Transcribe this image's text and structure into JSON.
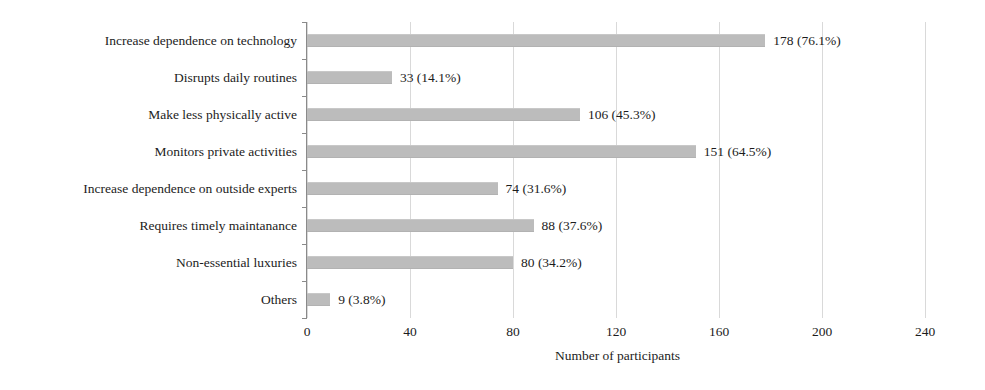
{
  "chart_data": {
    "type": "bar",
    "orientation": "horizontal",
    "title": "",
    "xlabel": "Number of participants",
    "ylabel": "",
    "xlim": [
      0,
      240
    ],
    "xticks": [
      0,
      40,
      80,
      120,
      160,
      200,
      240
    ],
    "xtick_labels": [
      "0",
      "40",
      "80",
      "120",
      "160",
      "200",
      "240"
    ],
    "grid": "vertical",
    "legend": "none",
    "bar_color": "#bcbcbc",
    "text_color": "#1c1c1c",
    "categories": [
      "Increase dependence on technology",
      "Disrupts daily routines",
      "Make less physically active",
      "Monitors private activities",
      "Increase dependence on outside experts",
      "Requires timely maintanance",
      "Non-essential luxuries",
      "Others"
    ],
    "values": [
      178,
      33,
      106,
      151,
      74,
      88,
      80,
      9
    ],
    "percents": [
      76.1,
      14.1,
      45.3,
      64.5,
      31.6,
      37.6,
      34.2,
      3.8
    ],
    "data_labels": [
      "178 (76.1%)",
      "33 (14.1%)",
      "106 (45.3%)",
      "151 (64.5%)",
      "74 (31.6%)",
      "88 (37.6%)",
      "80 (34.2%)",
      "9 (3.8%)"
    ]
  }
}
